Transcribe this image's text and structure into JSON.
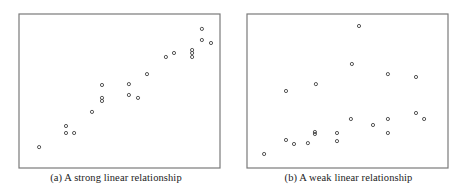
{
  "figure": {
    "panels": [
      {
        "id": "a",
        "caption": "(a) A strong linear relationship"
      },
      {
        "id": "b",
        "caption": "(b) A weak linear relationship"
      }
    ]
  },
  "chart_data": [
    {
      "type": "scatter",
      "title": "(a) A strong linear relationship",
      "xlabel": "",
      "ylabel": "",
      "xlim": [
        0,
        100
      ],
      "ylim": [
        0,
        100
      ],
      "grid": false,
      "axes_ticks": false,
      "marker": "open-circle",
      "x": [
        10.0,
        23.4,
        23.4,
        27.4,
        36.3,
        41.3,
        41.3,
        41.3,
        54.7,
        54.7,
        59.2,
        63.7,
        73.1,
        77.1,
        86.1,
        86.1,
        86.1,
        91.0,
        91.0,
        95.5
      ],
      "y": [
        13.6,
        27.3,
        22.7,
        22.7,
        36.4,
        53.9,
        45.5,
        43.5,
        54.5,
        47.4,
        45.5,
        61.0,
        72.1,
        74.7,
        76.6,
        74.7,
        72.1,
        90.3,
        83.1,
        81.2
      ]
    },
    {
      "type": "scatter",
      "title": "(b) A weak linear relationship",
      "xlabel": "",
      "ylabel": "",
      "xlim": [
        0,
        100
      ],
      "ylim": [
        0,
        100
      ],
      "grid": false,
      "axes_ticks": false,
      "marker": "open-circle",
      "x": [
        8.5,
        19.4,
        19.4,
        23.4,
        30.3,
        33.8,
        33.8,
        34.3,
        44.8,
        44.8,
        51.7,
        52.2,
        55.7,
        62.7,
        70.1,
        70.1,
        70.1,
        84.1,
        84.1,
        88.1
      ],
      "y": [
        9.1,
        50.0,
        18.2,
        15.6,
        16.2,
        23.4,
        22.1,
        54.5,
        22.7,
        17.5,
        31.8,
        67.5,
        92.2,
        27.9,
        61.0,
        31.8,
        22.7,
        59.1,
        35.7,
        31.8
      ]
    }
  ]
}
